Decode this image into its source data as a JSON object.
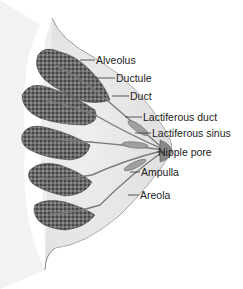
{
  "diagram": {
    "labels": [
      {
        "id": "alveolus",
        "text": "Alveolus",
        "x": 96,
        "y": 54
      },
      {
        "id": "ductule",
        "text": "Ductule",
        "x": 116,
        "y": 72
      },
      {
        "id": "duct",
        "text": "Duct",
        "x": 130,
        "y": 90
      },
      {
        "id": "lactiferous-duct",
        "text": "Lactiferous duct",
        "x": 143,
        "y": 111
      },
      {
        "id": "lactiferous-sinus",
        "text": "Lactiferous sinus",
        "x": 152,
        "y": 127
      },
      {
        "id": "nipple-pore",
        "text": "Nipple pore",
        "x": 158,
        "y": 146
      },
      {
        "id": "ampulla",
        "text": "Ampulla",
        "x": 141,
        "y": 166
      },
      {
        "id": "areola",
        "text": "Areola",
        "x": 140,
        "y": 189
      }
    ],
    "colors": {
      "lobule": "#5a5a5a",
      "tissue": "#e2e2e2",
      "outline": "#777777",
      "leader": "#333333"
    }
  }
}
